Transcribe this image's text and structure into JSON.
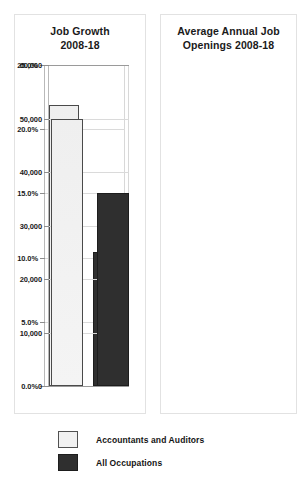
{
  "legend": {
    "items": [
      {
        "label": "Accountants and Auditors",
        "swatch": "light-swatch-icon",
        "color": "#f1f1f1"
      },
      {
        "label": "All Occupations",
        "swatch": "dark-swatch-icon",
        "color": "#2f2f2f"
      }
    ]
  },
  "chart_data": [
    {
      "type": "bar",
      "title": "Job Growth 2008-18",
      "title_line1": "Job Growth",
      "title_line2": "2008-18",
      "xlabel": "",
      "ylabel": "",
      "ylim": [
        0,
        25
      ],
      "ytick_labels": [
        "25.0%",
        "20.0%",
        "15.0%",
        "10.0%",
        "5.0%",
        "0.0%"
      ],
      "ytick_values": [
        25,
        20,
        15,
        10,
        5,
        0
      ],
      "grid": true,
      "legend_position": "bottom",
      "categories": [
        "Accountants and Auditors",
        "All Occupations"
      ],
      "values": [
        21.9,
        10.4
      ],
      "value_labels": [
        "21.9%",
        "10.4%"
      ],
      "colors": [
        "#f1f1f1",
        "#2f2f2f"
      ]
    },
    {
      "type": "bar",
      "title": "Average Annual Job Openings 2008-18",
      "title_line1": "Average Annual Job",
      "title_line2": "Openings 2008-18",
      "xlabel": "",
      "ylabel": "",
      "ylim": [
        0,
        60000
      ],
      "ytick_labels": [
        "60,000",
        "50,000",
        "40,000",
        "30,000",
        "20,000",
        "10,000",
        "0"
      ],
      "ytick_values": [
        60000,
        50000,
        40000,
        30000,
        20000,
        10000,
        0
      ],
      "grid": true,
      "legend_position": "bottom",
      "categories": [
        "Accountants and Auditors",
        "All Occupations"
      ],
      "values": [
        50000,
        36000
      ],
      "value_labels": [
        "50,000",
        "36,000"
      ],
      "colors": [
        "#f1f1f1",
        "#2f2f2f"
      ]
    }
  ]
}
